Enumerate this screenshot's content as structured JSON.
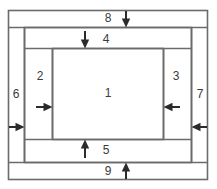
{
  "diagram": {
    "type": "nested-rectangle-layout-diagram",
    "colors": {
      "stroke": "#6b6b6b",
      "stroke_dark": "#4a4a4a",
      "label_text": "#3a3a3a",
      "background": "#ffffff",
      "arrow": "#2b2b2b"
    },
    "canvas": {
      "width": 217,
      "height": 189
    },
    "regions": [
      {
        "id": "region-1",
        "label": "1",
        "name": "center-region",
        "x": 108,
        "y": 93,
        "desc": "innermost central rectangle"
      },
      {
        "id": "region-2",
        "label": "2",
        "name": "left-inner-band",
        "x": 40,
        "y": 76,
        "desc": "left vertical band inside frame"
      },
      {
        "id": "region-3",
        "label": "3",
        "name": "right-inner-band",
        "x": 176,
        "y": 76,
        "desc": "right vertical band inside frame"
      },
      {
        "id": "region-4",
        "label": "4",
        "name": "top-inner-band",
        "x": 106,
        "y": 39,
        "desc": "top horizontal band inside frame"
      },
      {
        "id": "region-5",
        "label": "5",
        "name": "bottom-inner-band",
        "x": 106,
        "y": 150,
        "desc": "bottom horizontal band inside frame"
      },
      {
        "id": "region-6",
        "label": "6",
        "name": "left-outer-band",
        "x": 16,
        "y": 94,
        "desc": "left outer vertical band"
      },
      {
        "id": "region-7",
        "label": "7",
        "name": "right-outer-band",
        "x": 200,
        "y": 94,
        "desc": "right outer vertical band"
      },
      {
        "id": "region-8",
        "label": "8",
        "name": "top-outer-band",
        "x": 106,
        "y": 18,
        "desc": "top outer horizontal band"
      },
      {
        "id": "region-9",
        "label": "9",
        "name": "bottom-outer-band",
        "x": 106,
        "y": 171,
        "desc": "bottom outer horizontal band"
      }
    ],
    "arrows": [
      {
        "id": "arrow-8",
        "name": "arrow-top-outer-down",
        "direction": "down",
        "for_region": "8"
      },
      {
        "id": "arrow-4",
        "name": "arrow-top-inner-down",
        "direction": "down",
        "for_region": "4"
      },
      {
        "id": "arrow-6",
        "name": "arrow-left-outer-right",
        "direction": "right",
        "for_region": "6"
      },
      {
        "id": "arrow-2",
        "name": "arrow-left-inner-right",
        "direction": "right",
        "for_region": "2"
      },
      {
        "id": "arrow-7",
        "name": "arrow-right-outer-left",
        "direction": "left",
        "for_region": "7"
      },
      {
        "id": "arrow-3",
        "name": "arrow-right-inner-left",
        "direction": "left",
        "for_region": "3"
      },
      {
        "id": "arrow-5",
        "name": "arrow-bottom-inner-up",
        "direction": "up",
        "for_region": "5"
      },
      {
        "id": "arrow-9",
        "name": "arrow-bottom-outer-up",
        "direction": "up",
        "for_region": "9"
      }
    ]
  }
}
